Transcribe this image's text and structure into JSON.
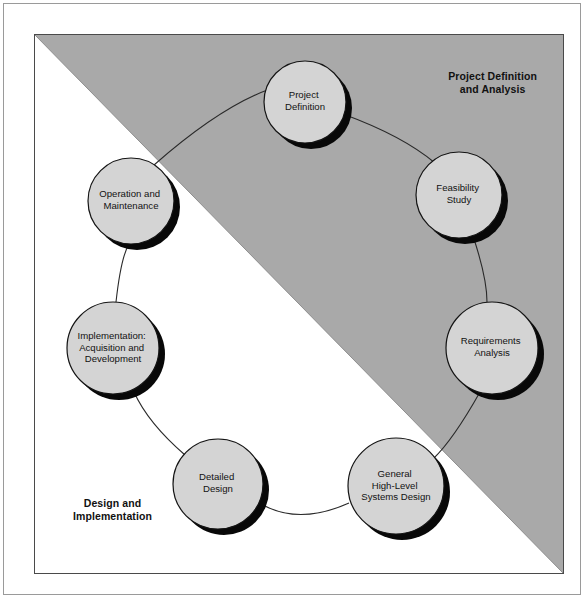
{
  "diagram": {
    "title_zones": {
      "top_right": "Project Definition\nand Analysis",
      "bottom_left": "Design and\nImplementation"
    },
    "colors": {
      "shaded_zone": "#a9a9a9",
      "unshaded_zone": "#ffffff",
      "node_fill": "#d4d4d4",
      "node_stroke": "#141414",
      "node_shadow": "#080808",
      "connector": "#2a2a2a",
      "frame": "#4a4a4a",
      "outer_frame": "#9a9a9a",
      "text": "#121212"
    },
    "nodes": [
      {
        "id": "project-definition",
        "lines": [
          "Project",
          "Definition"
        ],
        "cx": 270,
        "cy": 67,
        "r": 41,
        "zone": "top_right"
      },
      {
        "id": "feasibility-study",
        "lines": [
          "Feasibility",
          "Study"
        ],
        "cx": 424,
        "cy": 160,
        "r": 43,
        "zone": "top_right"
      },
      {
        "id": "requirements-analysis",
        "lines": [
          "Requirements",
          "Analysis"
        ],
        "cx": 457,
        "cy": 313,
        "r": 46,
        "zone": "top_right"
      },
      {
        "id": "general-high-level-systems-design",
        "lines": [
          "General",
          "High-Level",
          "Systems Design"
        ],
        "cx": 361,
        "cy": 451,
        "r": 48,
        "zone": "bottom_left"
      },
      {
        "id": "detailed-design",
        "lines": [
          "Detailed",
          "Design"
        ],
        "cx": 183,
        "cy": 449,
        "r": 45,
        "zone": "bottom_left"
      },
      {
        "id": "implementation-acquisition-and-development",
        "lines": [
          "Implementation:",
          "Acquisition and",
          "Development"
        ],
        "cx": 78,
        "cy": 313,
        "r": 46,
        "zone": "bottom_left"
      },
      {
        "id": "operation-and-maintenance",
        "lines": [
          "Operation and",
          "Maintenance"
        ],
        "cx": 96,
        "cy": 166,
        "r": 43,
        "zone": "bottom_left"
      }
    ],
    "connectors": [
      {
        "from": "operation-and-maintenance",
        "to": "project-definition"
      },
      {
        "from": "project-definition",
        "to": "feasibility-study"
      },
      {
        "from": "feasibility-study",
        "to": "requirements-analysis"
      },
      {
        "from": "requirements-analysis",
        "to": "general-high-level-systems-design"
      },
      {
        "from": "general-high-level-systems-design",
        "to": "detailed-design"
      },
      {
        "from": "detailed-design",
        "to": "implementation-acquisition-and-development"
      },
      {
        "from": "implementation-acquisition-and-development",
        "to": "operation-and-maintenance"
      }
    ]
  }
}
